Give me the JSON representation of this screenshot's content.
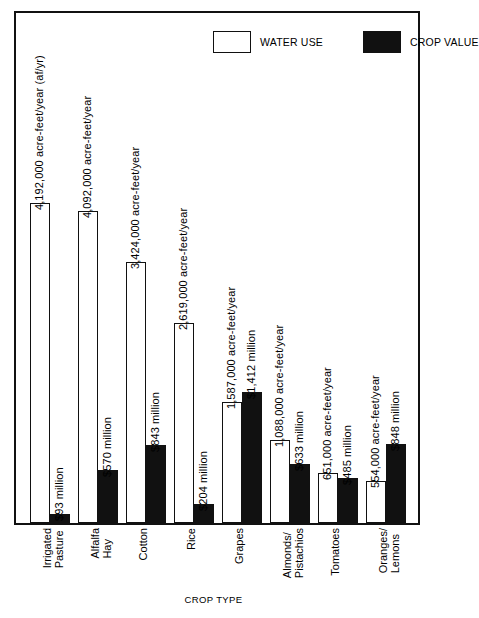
{
  "figure": {
    "axis_title": "CROP TYPE"
  },
  "legend": {
    "items": [
      {
        "label": "WATER USE",
        "swatch": "open-rectangle",
        "color": "#ffffff"
      },
      {
        "label": "CROP VALUE",
        "swatch": "filled-rectangle",
        "color": "#111111"
      }
    ]
  },
  "chart_data": {
    "type": "bar",
    "title": "",
    "subtitle": "",
    "xlabel": "CROP TYPE",
    "ylabel": "",
    "grid": false,
    "legend_position": "top-right",
    "orientation": "vertical",
    "grouping": "grouped",
    "units": {
      "water_use": "acre-feet/year (af/yr)",
      "crop_value": "million dollars"
    },
    "categories": [
      "Irrigated Pasture",
      "Alfalfa Hay",
      "Cotton",
      "Rice",
      "Grapes",
      "Almonds/ Pistachios",
      "Tomatoes",
      "Oranges/ Lemons"
    ],
    "series": [
      {
        "name": "WATER USE",
        "unit": "acre-feet/year",
        "values": [
          4192000,
          4092000,
          3424000,
          2619000,
          1587000,
          1088000,
          651000,
          554000
        ],
        "labels": [
          "4,192,000 acre-feet/year  (af/yr)",
          "4,092,000 acre-feet/year",
          "3,424,000 acre-feet/year",
          "2,619,000 acre-feet/year",
          "1,587,000 acre-feet/year",
          "1,088,000 acre-feet/year",
          "651,000 acre-feet/year",
          "554,000 acre-feet/year"
        ]
      },
      {
        "name": "CROP VALUE",
        "unit": "million dollars",
        "values": [
          93,
          570,
          843,
          204,
          1412,
          633,
          485,
          848
        ],
        "labels": [
          "$93 million",
          "$570 million",
          "$843 million",
          "$204 million",
          "$1,412 million",
          "$633 million",
          "$485 million",
          "$848 million"
        ]
      }
    ],
    "ylim_water": [
      0,
      4192000
    ],
    "ylim_value": [
      0,
      1412
    ]
  },
  "categories_display": [
    {
      "line1": "Irrigated",
      "line2": "Pasture"
    },
    {
      "line1": "Alfalfa",
      "line2": "Hay"
    },
    {
      "line1": "Cotton",
      "line2": ""
    },
    {
      "line1": "Rice",
      "line2": ""
    },
    {
      "line1": "Grapes",
      "line2": ""
    },
    {
      "line1": "Almonds/",
      "line2": "Pistachios"
    },
    {
      "line1": "Tomatoes",
      "line2": ""
    },
    {
      "line1": "Oranges/",
      "line2": "Lemons"
    }
  ]
}
